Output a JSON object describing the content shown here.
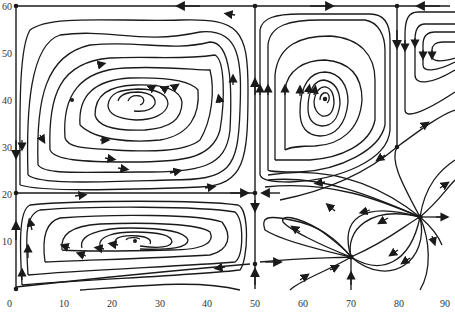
{
  "figure": {
    "type": "phase_portrait",
    "x_axis": {
      "min": 0,
      "max": 90,
      "ticks": [
        "0",
        "10",
        "20",
        "30",
        "40",
        "50",
        "60",
        "70",
        "80",
        "90"
      ]
    },
    "y_axis": {
      "min": 0,
      "max": 60,
      "ticks": [
        "0",
        "10",
        "20",
        "30",
        "40",
        "50",
        "60"
      ]
    },
    "caption": "",
    "colors": {
      "ink": "#1a1a1a",
      "background": "#ffffff",
      "tick_text": "#333333"
    }
  },
  "fixed_points": [
    {
      "name": "corner-top-left",
      "x": 0,
      "y": 60,
      "type": "saddle"
    },
    {
      "name": "top-mid",
      "x": 50,
      "y": 60,
      "type": "saddle"
    },
    {
      "name": "top-right",
      "x": 80,
      "y": 60,
      "type": "saddle"
    },
    {
      "name": "left-mid",
      "x": 0,
      "y": 20,
      "type": "saddle"
    },
    {
      "name": "center-mid",
      "x": 50,
      "y": 20,
      "type": "saddle"
    },
    {
      "name": "bottom-left",
      "x": 0,
      "y": 0,
      "type": "saddle"
    },
    {
      "name": "bottom-mid",
      "x": 50,
      "y": 5,
      "type": "saddle"
    },
    {
      "name": "right-saddle",
      "x": 80,
      "y": 31,
      "type": "saddle"
    },
    {
      "name": "spiral-upper-left",
      "x": 25,
      "y": 40,
      "type": "center"
    },
    {
      "name": "spiral-upper-mid",
      "x": 64,
      "y": 40,
      "type": "center"
    },
    {
      "name": "spiral-lower-left",
      "x": 25,
      "y": 12,
      "type": "center"
    },
    {
      "name": "source-right",
      "x": 85,
      "y": 15,
      "type": "node"
    },
    {
      "name": "source-lower",
      "x": 70,
      "y": 7,
      "type": "node"
    }
  ]
}
